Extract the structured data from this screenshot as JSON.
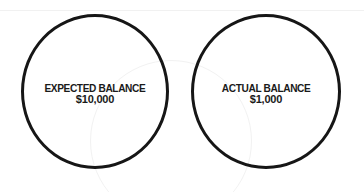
{
  "diagram": {
    "circles": [
      {
        "label": "EXPECTED BALANCE",
        "value": "$10,000"
      },
      {
        "label": "ACTUAL BALANCE",
        "value": "$1,000"
      }
    ],
    "colors": {
      "stroke": "#161616",
      "text": "#1a1a1a",
      "background": "#ffffff"
    }
  }
}
